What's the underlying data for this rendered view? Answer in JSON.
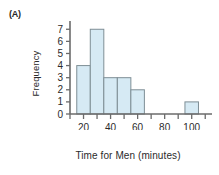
{
  "panel": {
    "label": "(A)"
  },
  "chart_data": {
    "type": "bar",
    "title": "",
    "subtitle": "",
    "xlabel": "Time for Men (minutes)",
    "ylabel": "Frequency",
    "histogram": true,
    "bin_width": 10,
    "bins": [
      {
        "start": 15,
        "end": 25,
        "label": "15-25",
        "value": 4
      },
      {
        "start": 25,
        "end": 35,
        "label": "25-35",
        "value": 7
      },
      {
        "start": 35,
        "end": 45,
        "label": "35-45",
        "value": 3
      },
      {
        "start": 45,
        "end": 55,
        "label": "45-55",
        "value": 3
      },
      {
        "start": 55,
        "end": 65,
        "label": "55-65",
        "value": 2
      },
      {
        "start": 65,
        "end": 75,
        "label": "65-75",
        "value": 0
      },
      {
        "start": 75,
        "end": 85,
        "label": "75-85",
        "value": 0
      },
      {
        "start": 85,
        "end": 95,
        "label": "85-95",
        "value": 0
      },
      {
        "start": 95,
        "end": 105,
        "label": "95-105",
        "value": 1
      }
    ],
    "categories": [
      "15-25",
      "25-35",
      "35-45",
      "45-55",
      "55-65",
      "65-75",
      "75-85",
      "85-95",
      "95-105"
    ],
    "values": [
      4,
      7,
      3,
      3,
      2,
      0,
      0,
      0,
      1
    ],
    "xlim": [
      10,
      115
    ],
    "ylim": [
      0,
      7.6
    ],
    "xticks": [
      10,
      20,
      30,
      40,
      50,
      60,
      70,
      80,
      90,
      100,
      110
    ],
    "xticklabels": [
      "",
      "20",
      "",
      "40",
      "",
      "60",
      "",
      "80",
      "",
      "100",
      ""
    ],
    "yticks": [
      0,
      1,
      2,
      3,
      4,
      5,
      6,
      7
    ],
    "yticklabels": [
      "0",
      "1",
      "2",
      "3",
      "4",
      "5",
      "6",
      "7"
    ],
    "grid": false,
    "legend": null,
    "colors": {
      "bar_fill": "#d6eaf4",
      "bar_edge": "#7e8e95",
      "axis": "#6b6b6b",
      "text": "#2b2b2b"
    }
  }
}
